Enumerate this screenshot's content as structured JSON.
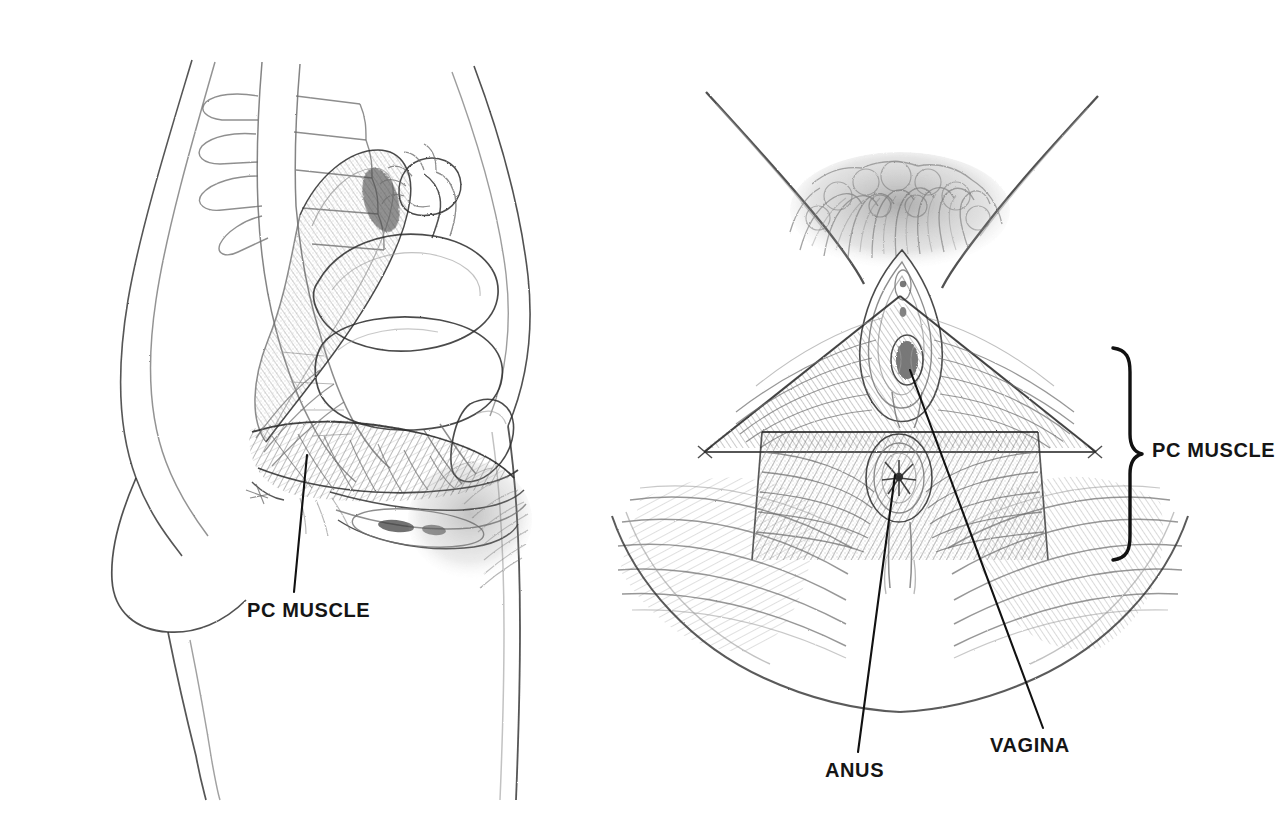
{
  "document": {
    "title": "Pelvic Floor Anatomy — PC Muscle",
    "background_color": "#ffffff",
    "ink_color": "#2b2b2b",
    "label_color": "#151515",
    "width": 1267,
    "height": 818
  },
  "labels": {
    "pc_muscle_left": "PC MUSCLE",
    "pc_muscle_right": "PC MUSCLE",
    "anus": "ANUS",
    "vagina": "VAGINA"
  },
  "figures": [
    {
      "id": "sagittal",
      "name": "sagittal-pelvis-view",
      "description": "Side (sagittal) cut-away view of the female pelvis showing lumbar spine, sacrum, rectum, uterus, bladder, pubic bone and the pelvic floor.",
      "callouts": [
        {
          "label": "PC MUSCLE",
          "leader_from": [
            307,
            455
          ],
          "leader_to": [
            294,
            592
          ],
          "text_position": [
            247,
            600
          ]
        }
      ]
    },
    {
      "id": "perineal",
      "name": "perineal-inferior-view",
      "description": "Inferior (perineal) view between the thighs showing the pubococcygeus muscle sling, the vaginal opening and the anus.",
      "callouts": [
        {
          "label": "VAGINA",
          "leader_from": [
            910,
            370
          ],
          "leader_to": [
            1043,
            728
          ],
          "text_position": [
            990,
            735
          ]
        },
        {
          "label": "ANUS",
          "leader_from": [
            895,
            475
          ],
          "leader_to": [
            858,
            752
          ],
          "text_position": [
            825,
            760
          ]
        },
        {
          "label": "PC MUSCLE",
          "brace_top": [
            1113,
            348
          ],
          "brace_bottom": [
            1113,
            560
          ],
          "brace_point": [
            1142,
            454
          ],
          "text_position": [
            1152,
            440
          ]
        }
      ]
    }
  ]
}
